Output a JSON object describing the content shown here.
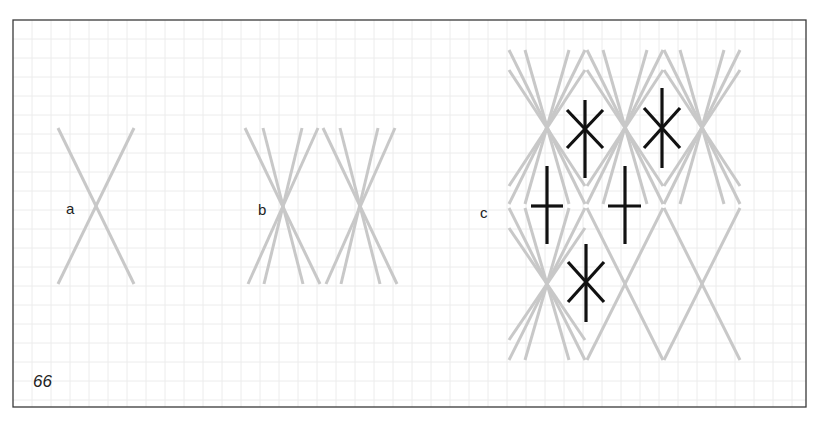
{
  "figure": {
    "number": "66",
    "panel_labels": {
      "a": "a",
      "b": "b",
      "c": "c"
    },
    "colors": {
      "frame": "#3a3a3a",
      "grid": "#ececec",
      "light_stitch": "#c8c8c8",
      "dark_stitch": "#111111",
      "label": "#222222"
    },
    "grid": {
      "spacing_px": 19,
      "left": 13,
      "top": 20,
      "right": 806,
      "bottom": 407
    },
    "panels": [
      {
        "id": "a",
        "description": "Single cross made of two long grey straight stitches"
      },
      {
        "id": "b",
        "description": "Two sheaves, each of four grey stitches crossing at center"
      },
      {
        "id": "c",
        "description": "Diamond pattern of grey sheaves with black star and cross filling stitches"
      }
    ]
  }
}
